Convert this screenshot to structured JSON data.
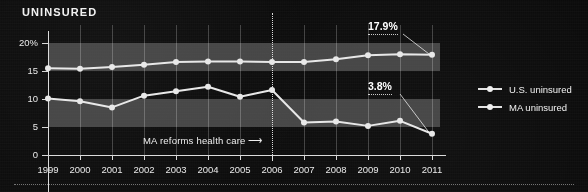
{
  "title": "UNINSURED",
  "colors": {
    "background": "#0b0b0b",
    "band": "#6a6a6a",
    "line": "#e8e8e8",
    "text": "#f0f0f0",
    "reform_marker": "#ebebeb"
  },
  "annotations": {
    "us_label": "17.9%",
    "ma_label": "3.8%",
    "reform_note": "MA reforms health care  ⟶"
  },
  "legend": {
    "position": "right",
    "items": [
      {
        "name": "us-uninsured",
        "label": "U.S. uninsured"
      },
      {
        "name": "ma-uninsured",
        "label": "MA uninsured"
      }
    ]
  },
  "axis": {
    "y_ticks": [
      "20%",
      "15",
      "10",
      "5",
      "0"
    ],
    "x_ticks": [
      "1999",
      "2000",
      "2001",
      "2002",
      "2003",
      "2004",
      "2005",
      "2006",
      "2007",
      "2008",
      "2009",
      "2010",
      "2011"
    ]
  },
  "chart_data": {
    "type": "line",
    "title": "UNINSURED",
    "xlabel": "",
    "ylabel": "",
    "ylim": [
      0,
      20
    ],
    "xlim": [
      1999,
      2011
    ],
    "grid": "horizontal-bands",
    "legend_position": "right",
    "categories": [
      1999,
      2000,
      2001,
      2002,
      2003,
      2004,
      2005,
      2006,
      2007,
      2008,
      2009,
      2010,
      2011
    ],
    "series": [
      {
        "name": "U.S. uninsured",
        "values": [
          15.5,
          15.4,
          15.7,
          16.1,
          16.6,
          16.7,
          16.7,
          16.6,
          16.6,
          17.1,
          17.8,
          18.0,
          17.9
        ]
      },
      {
        "name": "MA uninsured",
        "values": [
          10.1,
          9.6,
          8.5,
          10.6,
          11.4,
          12.2,
          10.4,
          11.6,
          5.8,
          6.0,
          5.2,
          6.1,
          3.8
        ]
      }
    ],
    "annotations": [
      {
        "text": "17.9%",
        "series": "U.S. uninsured",
        "x": 2011,
        "y": 17.9
      },
      {
        "text": "3.8%",
        "series": "MA uninsured",
        "x": 2011,
        "y": 3.8
      },
      {
        "text": "MA reforms health care",
        "x": 2006,
        "type": "vertical-marker"
      }
    ]
  }
}
